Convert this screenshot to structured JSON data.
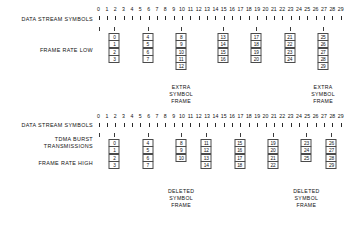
{
  "figure": {
    "scale": {
      "name": "data-stream-symbol-scale",
      "labels": [
        "0",
        "1",
        "2",
        "3",
        "4",
        "5",
        "6",
        "7",
        "8",
        "9",
        "10",
        "11",
        "12",
        "13",
        "14",
        "15",
        "16",
        "17",
        "18",
        "19",
        "20",
        "21",
        "22",
        "23",
        "24",
        "25",
        "26",
        "27",
        "28",
        "29"
      ],
      "min": 0,
      "max": 29,
      "count": 30
    },
    "panels": [
      {
        "id": "frame-rate-low",
        "labels": {
          "scale_label": "DATA STREAM SYMBOLS",
          "row_label": "FRAME RATE LOW"
        },
        "lead_stem": true,
        "groups": [
          {
            "start_symbol": 0,
            "symbols": [
              "0",
              "1",
              "2",
              "3"
            ]
          },
          {
            "start_symbol": 4,
            "symbols": [
              "4",
              "5",
              "6",
              "7"
            ]
          },
          {
            "start_symbol": 8,
            "symbols": [
              "8",
              "9",
              "10",
              "11",
              "12"
            ]
          },
          {
            "start_symbol": 13,
            "symbols": [
              "13",
              "14",
              "15",
              "16"
            ]
          },
          {
            "start_symbol": 17,
            "symbols": [
              "17",
              "18",
              "19",
              "20"
            ]
          },
          {
            "start_symbol": 21,
            "symbols": [
              "21",
              "22",
              "23",
              "24"
            ]
          },
          {
            "start_symbol": 25,
            "symbols": [
              "25",
              "26",
              "27",
              "28",
              "29"
            ]
          }
        ],
        "annotations": [
          {
            "group_index": 2,
            "lines": [
              "EXTRA",
              "SYMBOL",
              "FRAME"
            ]
          },
          {
            "group_index": 6,
            "lines": [
              "EXTRA",
              "SYMBOL",
              "FRAME"
            ]
          }
        ]
      },
      {
        "id": "frame-rate-high",
        "labels": {
          "scale_label": "DATA STREAM SYMBOLS",
          "burst_label_line1": "TDMA BURST",
          "burst_label_line2": "TRANSMISSIONS",
          "row_label": "FRAME RATE HIGH"
        },
        "lead_stem": true,
        "groups": [
          {
            "start_symbol": 0,
            "symbols": [
              "0",
              "1",
              "2",
              "3"
            ]
          },
          {
            "start_symbol": 4,
            "symbols": [
              "4",
              "5",
              "6",
              "7"
            ]
          },
          {
            "start_symbol": 8,
            "symbols": [
              "8",
              "9",
              "10"
            ]
          },
          {
            "start_symbol": 11,
            "symbols": [
              "11",
              "12",
              "13",
              "14"
            ]
          },
          {
            "start_symbol": 15,
            "symbols": [
              "15",
              "16",
              "17",
              "18"
            ]
          },
          {
            "start_symbol": 19,
            "symbols": [
              "19",
              "20",
              "21",
              "22"
            ]
          },
          {
            "start_symbol": 23,
            "symbols": [
              "23",
              "24",
              "25"
            ]
          },
          {
            "start_symbol": 26,
            "symbols": [
              "26",
              "27",
              "28",
              "29"
            ]
          }
        ],
        "annotations": [
          {
            "group_index": 2,
            "lines": [
              "DELETED",
              "SYMBOL",
              "FRAME"
            ]
          },
          {
            "group_index": 6,
            "lines": [
              "DELETED",
              "SYMBOL",
              "FRAME"
            ]
          }
        ]
      }
    ],
    "colors": {
      "ink": "#111111",
      "box_border": "#4a4a4a",
      "tick": "#2a2a2a",
      "background": "#ffffff"
    }
  }
}
